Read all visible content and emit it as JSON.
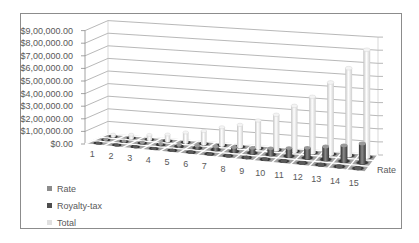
{
  "chart_data": {
    "type": "bar",
    "subtype": "3d-column",
    "title": "",
    "xlabel": "",
    "ylabel": "",
    "categories": [
      "1",
      "2",
      "3",
      "4",
      "5",
      "6",
      "7",
      "8",
      "9",
      "10",
      "11",
      "12",
      "13",
      "14",
      "15"
    ],
    "series": [
      {
        "name": "Rate",
        "color": "#8c8c8c",
        "values": [
          0,
          0,
          0,
          0,
          0,
          0,
          0,
          0,
          0,
          0,
          0,
          0,
          0,
          0,
          0
        ]
      },
      {
        "name": "Royalty-tax",
        "color": "#4d4d4d",
        "values": [
          2700,
          4500,
          6300,
          9000,
          13900,
          18000,
          25200,
          30600,
          38700,
          48600,
          63000,
          77400,
          99000,
          120600,
          147600
        ]
      },
      {
        "name": "Total",
        "color": "#e6e6e6",
        "values": [
          15000,
          25000,
          35000,
          50000,
          77000,
          100000,
          140000,
          170000,
          215000,
          270000,
          350000,
          430000,
          550000,
          670000,
          820000
        ]
      }
    ],
    "y_axis": {
      "min": 0,
      "max": 900000,
      "step": 100000,
      "tick_labels": [
        "$0.00",
        "$1,00,000.00",
        "$2,00,000.00",
        "$3,00,000.00",
        "$4,00,000.00",
        "$5,00,000.00",
        "$6,00,000.00",
        "$7,00,000.00",
        "$8,00,000.00",
        "$9,00,000.00"
      ]
    },
    "depth_axis_label": "Rate",
    "grid": true,
    "legend": {
      "position": "bottom-left",
      "entries": [
        "Rate",
        "Royalty-tax",
        "Total"
      ]
    }
  },
  "legend": {
    "items": [
      {
        "label": "Rate",
        "color": "#8c8c8c"
      },
      {
        "label": "Royalty-tax",
        "color": "#4d4d4d"
      },
      {
        "label": "Total",
        "color": "#e0e0e0"
      }
    ]
  }
}
